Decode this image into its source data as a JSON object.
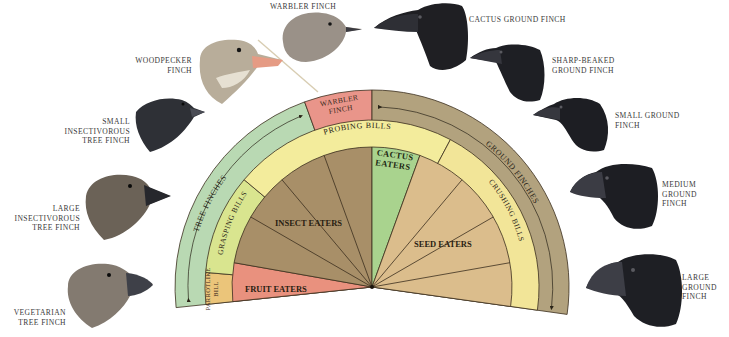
{
  "diagram": {
    "colors": {
      "tree_ring": "#b9d9b3",
      "ground_ring": "#b2a27e",
      "warbler_box": "#e9958a",
      "probing": "#f3ec9c",
      "grasping": "#d9e58f",
      "parrotlike": "#ebc57a",
      "crushing": "#f2e598",
      "insect": "#a88f68",
      "fruit": "#e9917e",
      "cactus": "#a9d38e",
      "seed": "#dbbd8c",
      "line": "#3b2e1e"
    },
    "outer_ring": {
      "tree_finches": "TREE FINCHES",
      "ground_finches": "GROUND FINCHES",
      "warbler_finch": [
        "WARBLER",
        "FINCH"
      ]
    },
    "bill_ring": {
      "probing": "PROBING BILLS",
      "grasping": "GRASPING BILLS",
      "parrotlike": [
        "PARROTLIKE",
        "BILL"
      ],
      "crushing": "CRUSHING BILLS"
    },
    "diets": {
      "insect": "INSECT EATERS",
      "fruit": "FRUIT EATERS",
      "cactus": [
        "CACTUS",
        "EATERS"
      ],
      "seed": "SEED EATERS"
    }
  },
  "birds": {
    "warbler": "WARBLER FINCH",
    "woodpecker": "WOODPECKER\nFINCH",
    "small_insectivorous": "SMALL\nINSECTIVOROUS\nTREE FINCH",
    "large_insectivorous": "LARGE\nINSECTIVOROUS\nTREE FINCH",
    "vegetarian": "VEGETARIAN\nTREE FINCH",
    "cactus_ground": "CACTUS GROUND FINCH",
    "sharp_beaked": "SHARP-BEAKED\nGROUND FINCH",
    "small_ground": "SMALL GROUND\nFINCH",
    "medium_ground": "MEDIUM\nGROUND\nFINCH",
    "large_ground": "LARGE\nGROUND\nFINCH"
  }
}
